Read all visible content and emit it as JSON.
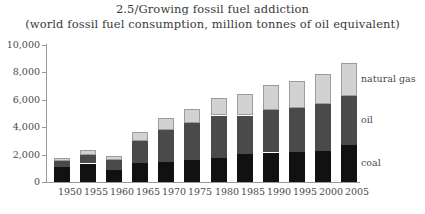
{
  "chart_data": {
    "type": "bar",
    "title": "2.5/Growing fossil fuel addiction",
    "subtitle": "(world fossil fuel consumption, million tonnes of oil equivalent)",
    "xlabel": "",
    "ylabel": "",
    "ylim": [
      0,
      10000
    ],
    "ytick_labels": [
      "0",
      "2,000",
      "4,000",
      "6,000",
      "8,000",
      "10,000"
    ],
    "ytick_values": [
      0,
      2000,
      4000,
      6000,
      8000,
      10000
    ],
    "grid": false,
    "stacked": true,
    "legend_position": "inside-right-on-last-bar",
    "categories": [
      "1950",
      "1955",
      "1960",
      "1965",
      "1970",
      "1975",
      "1980",
      "1985",
      "1990",
      "1995",
      "2000",
      "2005"
    ],
    "series": [
      {
        "name": "coal",
        "color": "#111111",
        "values": [
          1100,
          1350,
          900,
          1400,
          1500,
          1600,
          1800,
          2050,
          2150,
          2200,
          2250,
          2750
        ]
      },
      {
        "name": "oil",
        "color": "#4a4a4a",
        "values": [
          450,
          620,
          700,
          1600,
          2300,
          2700,
          3050,
          2800,
          3100,
          3250,
          3450,
          3550
        ]
      },
      {
        "name": "natural gas",
        "color": "#d2d2d2",
        "values": [
          230,
          330,
          280,
          650,
          900,
          1050,
          1250,
          1550,
          1800,
          1950,
          2200,
          2400
        ]
      }
    ],
    "totals": [
      1780,
      2300,
      1880,
      3650,
      4700,
      5350,
      6100,
      6400,
      7050,
      7400,
      7900,
      8700
    ]
  },
  "legend": {
    "items": [
      {
        "label": "natural gas",
        "color": "#d2d2d2"
      },
      {
        "label": "oil",
        "color": "#4a4a4a"
      },
      {
        "label": "coal",
        "color": "#111111"
      }
    ]
  },
  "axis": {
    "line_color": "#9a9a9a"
  }
}
